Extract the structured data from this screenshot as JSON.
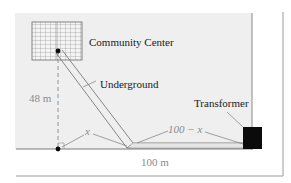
{
  "diagram": {
    "labels": {
      "building": "Community Center",
      "cable": "Underground",
      "transformer": "Transformer",
      "height": "48 m",
      "x_segment": "x",
      "remaining_segment": "100 − x",
      "total_width": "100 m"
    },
    "colors": {
      "panel": "#efefef",
      "line": "#7a7a7a",
      "grid": "#888888",
      "transformer": "#0b0b0b",
      "label_gray": "#8a8a8a"
    }
  }
}
